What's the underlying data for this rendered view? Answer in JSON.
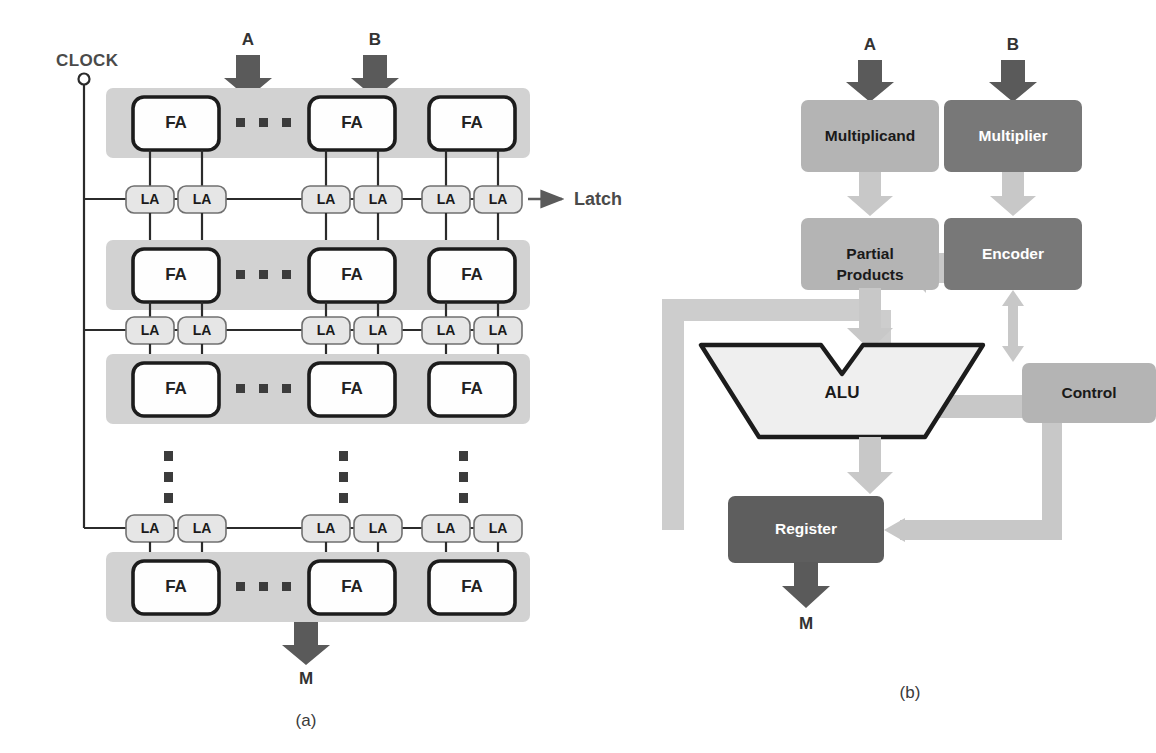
{
  "figure": {
    "panel_a": {
      "caption": "(a)",
      "clock_label": "CLOCK",
      "latch_label": "Latch",
      "input_a": "A",
      "input_b": "B",
      "output_m": "M",
      "fa_label": "FA",
      "la_label": "LA",
      "rows": [
        {
          "fa_cells": [
            "FA",
            "FA",
            "FA"
          ],
          "has_horizontal_dots": true
        },
        {
          "fa_cells": [
            "FA",
            "FA",
            "FA"
          ],
          "has_horizontal_dots": true
        },
        {
          "fa_cells": [
            "FA",
            "FA",
            "FA"
          ],
          "has_horizontal_dots": true
        },
        {
          "fa_cells": [
            "FA",
            "FA",
            "FA"
          ],
          "has_horizontal_dots": true
        }
      ],
      "latch_rows": [
        [
          "LA",
          "LA",
          "LA",
          "LA",
          "LA",
          "LA"
        ],
        [
          "LA",
          "LA",
          "LA",
          "LA",
          "LA",
          "LA"
        ],
        [
          "LA",
          "LA",
          "LA",
          "LA",
          "LA",
          "LA"
        ]
      ],
      "vertical_dot_columns": 3
    },
    "panel_b": {
      "caption": "(b)",
      "input_a": "A",
      "input_b": "B",
      "output_m": "M",
      "blocks": {
        "multiplicand": "Multiplicand",
        "multiplier": "Multiplier",
        "partial_products_line1": "Partial",
        "partial_products_line2": "Products",
        "encoder": "Encoder",
        "alu": "ALU",
        "control": "Control",
        "register": "Register"
      }
    }
  },
  "colors": {
    "band_gray": "#d2d2d2",
    "box_white": "#fefefe",
    "box_border_dark": "#1c1c1c",
    "la_fill": "#e6e6e6",
    "arrow_dark": "#5a5a5a",
    "arrow_light": "#c8c8c8",
    "block_mid_gray": "#b4b4b4",
    "block_dark_gray": "#787878",
    "register_dark": "#5e5e5e",
    "alu_fill": "#efefef",
    "line_dark": "#2b2b2b",
    "dot_dark": "#3c3c3c"
  }
}
